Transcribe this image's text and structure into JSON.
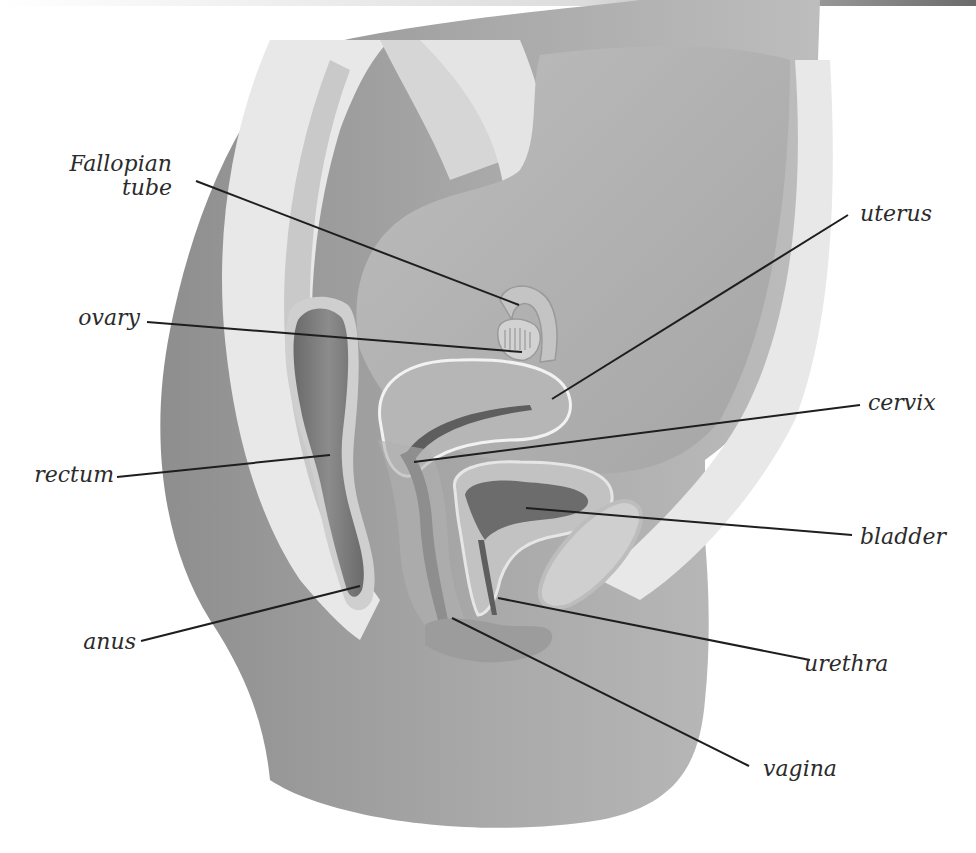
{
  "diagram": {
    "colors": {
      "background": "#ffffff",
      "body_outer": "#9a9a9a",
      "body_inner": "#b4b4b4",
      "pale_tissue": "#e6e6e6",
      "organ_mid": "#a8a8a8",
      "organ_dark": "#6e6e6e",
      "leader_line": "#1e1e1e",
      "label_text": "#2b2b2b"
    },
    "labels": [
      {
        "id": "fallopian-tube",
        "text": "Fallopian\ntube",
        "x": 62,
        "y": 152,
        "align": "right",
        "width": 110,
        "line": [
          196,
          181,
          519,
          305
        ]
      },
      {
        "id": "ovary",
        "text": "ovary",
        "x": 78,
        "y": 306,
        "align": "right",
        "width": 62,
        "line": [
          147,
          322,
          522,
          352
        ]
      },
      {
        "id": "rectum",
        "text": "rectum",
        "x": 34,
        "y": 463,
        "align": "right",
        "width": 80,
        "line": [
          117,
          477,
          330,
          455
        ]
      },
      {
        "id": "anus",
        "text": "anus",
        "x": 80,
        "y": 630,
        "align": "right",
        "width": 56,
        "line": [
          141,
          641,
          360,
          586
        ]
      },
      {
        "id": "uterus",
        "text": "uterus",
        "x": 860,
        "y": 202,
        "align": "left",
        "width": 80,
        "line": [
          848,
          215,
          552,
          399
        ]
      },
      {
        "id": "cervix",
        "text": "cervix",
        "x": 868,
        "y": 391,
        "align": "left",
        "width": 80,
        "line": [
          860,
          405,
          414,
          462
        ]
      },
      {
        "id": "bladder",
        "text": "bladder",
        "x": 860,
        "y": 525,
        "align": "left",
        "width": 100,
        "line": [
          852,
          535,
          526,
          508
        ]
      },
      {
        "id": "urethra",
        "text": "urethra",
        "x": 804,
        "y": 652,
        "align": "left",
        "width": 100,
        "line": [
          810,
          660,
          498,
          598
        ]
      },
      {
        "id": "vagina",
        "text": "vagina",
        "x": 763,
        "y": 757,
        "align": "left",
        "width": 90,
        "line": [
          749,
          766,
          452,
          618
        ]
      }
    ]
  }
}
